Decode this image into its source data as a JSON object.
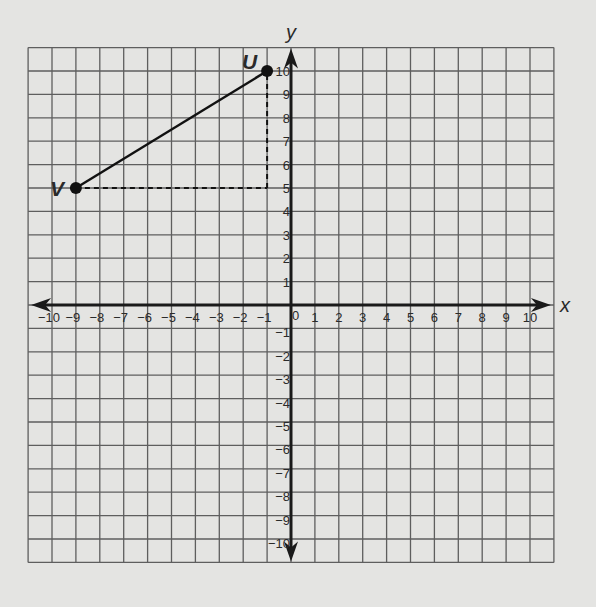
{
  "chart_data": {
    "type": "scatter",
    "title": "",
    "xlabel": "x",
    "ylabel": "y",
    "xlim": [
      -11,
      11
    ],
    "ylim": [
      -11,
      11
    ],
    "grid": true,
    "x_tick_labels": [
      "−10",
      "−9",
      "−8",
      "−7",
      "−6",
      "−5",
      "−4",
      "−3",
      "−2",
      "−1",
      "0",
      "1",
      "2",
      "3",
      "4",
      "5",
      "6",
      "7",
      "8",
      "9",
      "10"
    ],
    "y_tick_labels": [
      "10",
      "9",
      "8",
      "7",
      "6",
      "5",
      "4",
      "3",
      "2",
      "1",
      "−1",
      "−2",
      "−3",
      "−4",
      "−5",
      "−6",
      "−7",
      "−8",
      "−9",
      "−10"
    ],
    "points": [
      {
        "label": "U",
        "x": -1,
        "y": 10
      },
      {
        "label": "V",
        "x": -9,
        "y": 5
      }
    ],
    "segments": [
      {
        "from": "V",
        "to": "U",
        "style": "solid"
      },
      {
        "from": [
          -9,
          5
        ],
        "to": [
          -1,
          5
        ],
        "style": "dashed"
      },
      {
        "from": [
          -1,
          5
        ],
        "to": [
          -1,
          10
        ],
        "style": "dashed"
      }
    ]
  },
  "layout": {
    "origin_px": [
      291,
      305
    ],
    "x_unit_px": 23.9,
    "y_unit_px": 23.4,
    "colors": {
      "background": "#e4e4e2",
      "grid": "#5e5e5e",
      "axis": "#1a1a1a",
      "ink": "#111111"
    }
  }
}
